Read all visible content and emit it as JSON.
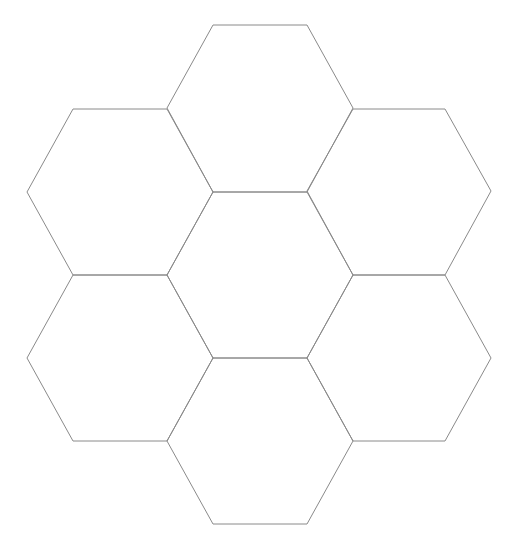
{
  "diagram": {
    "type": "hexagonal-tessellation",
    "background_color": "#ffffff",
    "stroke_color": "#8a8a8a",
    "hexagons": [
      {
        "name": "top",
        "points": "213,25 307,25 353,108 307,192 213,192 167,108"
      },
      {
        "name": "upper-left",
        "points": "73,109 167,109 213,192 167,275 73,275 27,192"
      },
      {
        "name": "upper-right",
        "points": "353,109 445,109 491,191 445,275 353,275 307,191"
      },
      {
        "name": "center",
        "points": "213,192 307,192 353,275 307,358 213,358 167,275"
      },
      {
        "name": "lower-left",
        "points": "73,275 167,275 213,358 167,441 73,441 27,358"
      },
      {
        "name": "lower-right",
        "points": "353,275 445,275 491,358 445,441 353,441 307,358"
      },
      {
        "name": "bottom",
        "points": "213,358 307,358 353,441 307,524 213,524 167,441"
      }
    ]
  }
}
